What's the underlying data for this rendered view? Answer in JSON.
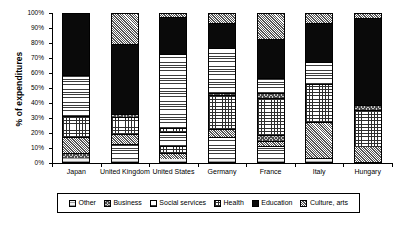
{
  "chart_data": {
    "type": "bar",
    "subtype": "stacked-100-percent",
    "title": "",
    "xlabel": "",
    "ylabel": "% of expenditures",
    "ylim": [
      0,
      100
    ],
    "yticks": [
      "0%",
      "10%",
      "20%",
      "30%",
      "40%",
      "50%",
      "60%",
      "70%",
      "80%",
      "90%",
      "100%"
    ],
    "ytick_values": [
      0,
      10,
      20,
      30,
      40,
      50,
      60,
      70,
      80,
      90,
      100
    ],
    "grid": false,
    "legend_position": "bottom",
    "categories": [
      "Japan",
      "United Kingdom",
      "United States",
      "Germany",
      "France",
      "Italy",
      "Hungary"
    ],
    "series": [
      {
        "name": "Other",
        "pattern": "light-dots",
        "values": [
          3,
          2,
          2,
          2,
          2,
          2,
          1
        ]
      },
      {
        "name": "Business",
        "pattern": "checker",
        "values": [
          3,
          1,
          3,
          1,
          1,
          1,
          9
        ]
      },
      {
        "name": "Social services",
        "pattern": "horizontal-lines",
        "values": [
          11,
          9,
          1,
          15,
          9,
          1,
          0
        ]
      },
      {
        "name": "Health",
        "pattern": "grid",
        "values": [
          14,
          7,
          5,
          4,
          5,
          23,
          25
        ]
      },
      {
        "name": "Education",
        "pattern": "solid-black",
        "values": [
          27,
          20,
          9,
          23,
          26,
          15,
          3
        ]
      },
      {
        "name": "Culture, arts",
        "pattern": "stipple",
        "values": [
          42,
          61,
          80,
          55,
          57,
          58,
          62
        ]
      }
    ],
    "stacks": [
      {
        "category": "Japan",
        "segments": [
          {
            "name": "Other",
            "start": 0,
            "end": 3,
            "value": 3
          },
          {
            "name": "Business",
            "start": 3,
            "end": 6,
            "value": 3
          },
          {
            "name": "Culture, arts",
            "start": 6,
            "end": 17,
            "value": 11
          },
          {
            "name": "Health",
            "start": 17,
            "end": 31,
            "value": 14
          },
          {
            "name": "Social services",
            "start": 31,
            "end": 58,
            "value": 27
          },
          {
            "name": "Education",
            "start": 58,
            "end": 100,
            "value": 42
          }
        ]
      },
      {
        "category": "United Kingdom",
        "segments": [
          {
            "name": "Other",
            "start": 0,
            "end": 2,
            "value": 2
          },
          {
            "name": "Social services",
            "start": 2,
            "end": 12,
            "value": 10
          },
          {
            "name": "Culture, arts",
            "start": 12,
            "end": 19,
            "value": 7
          },
          {
            "name": "Health",
            "start": 19,
            "end": 30,
            "value": 11
          },
          {
            "name": "Business",
            "start": 30,
            "end": 32,
            "value": 2
          },
          {
            "name": "Education",
            "start": 32,
            "end": 79,
            "value": 47
          },
          {
            "name": "Culture, arts",
            "start": 79,
            "end": 100,
            "value": 21
          }
        ]
      },
      {
        "category": "United States",
        "segments": [
          {
            "name": "Other",
            "start": 0,
            "end": 2,
            "value": 2
          },
          {
            "name": "Culture, arts",
            "start": 2,
            "end": 6,
            "value": 4
          },
          {
            "name": "Health",
            "start": 6,
            "end": 11,
            "value": 5
          },
          {
            "name": "Social services",
            "start": 11,
            "end": 20,
            "value": 9
          },
          {
            "name": "Health",
            "start": 20,
            "end": 23,
            "value": 3
          },
          {
            "name": "Social services",
            "start": 23,
            "end": 72,
            "value": 49
          },
          {
            "name": "Education",
            "start": 72,
            "end": 97,
            "value": 25
          },
          {
            "name": "Culture, arts",
            "start": 97,
            "end": 100,
            "value": 3
          }
        ]
      },
      {
        "category": "Germany",
        "segments": [
          {
            "name": "Other",
            "start": 0,
            "end": 2,
            "value": 2
          },
          {
            "name": "Social services",
            "start": 2,
            "end": 17,
            "value": 15
          },
          {
            "name": "Culture, arts",
            "start": 17,
            "end": 22,
            "value": 5
          },
          {
            "name": "Health",
            "start": 22,
            "end": 45,
            "value": 23
          },
          {
            "name": "Business",
            "start": 45,
            "end": 46,
            "value": 1
          },
          {
            "name": "Social services",
            "start": 46,
            "end": 76,
            "value": 30
          },
          {
            "name": "Education",
            "start": 76,
            "end": 93,
            "value": 17
          },
          {
            "name": "Culture, arts",
            "start": 93,
            "end": 100,
            "value": 7
          }
        ]
      },
      {
        "category": "France",
        "segments": [
          {
            "name": "Other",
            "start": 0,
            "end": 2,
            "value": 2
          },
          {
            "name": "Social services",
            "start": 2,
            "end": 11,
            "value": 9
          },
          {
            "name": "Culture, arts",
            "start": 11,
            "end": 14,
            "value": 3
          },
          {
            "name": "Business",
            "start": 14,
            "end": 18,
            "value": 4
          },
          {
            "name": "Health",
            "start": 18,
            "end": 43,
            "value": 25
          },
          {
            "name": "Business",
            "start": 43,
            "end": 46,
            "value": 3
          },
          {
            "name": "Social services",
            "start": 46,
            "end": 56,
            "value": 10
          },
          {
            "name": "Education",
            "start": 56,
            "end": 82,
            "value": 26
          },
          {
            "name": "Culture, arts",
            "start": 82,
            "end": 100,
            "value": 18
          }
        ]
      },
      {
        "category": "Italy",
        "segments": [
          {
            "name": "Other",
            "start": 0,
            "end": 2,
            "value": 2
          },
          {
            "name": "Business",
            "start": 2,
            "end": 3,
            "value": 1
          },
          {
            "name": "Culture, arts",
            "start": 3,
            "end": 27,
            "value": 24
          },
          {
            "name": "Health",
            "start": 27,
            "end": 52,
            "value": 25
          },
          {
            "name": "Social services",
            "start": 52,
            "end": 67,
            "value": 15
          },
          {
            "name": "Education",
            "start": 67,
            "end": 93,
            "value": 26
          },
          {
            "name": "Culture, arts",
            "start": 93,
            "end": 100,
            "value": 7
          }
        ]
      },
      {
        "category": "Hungary",
        "segments": [
          {
            "name": "Culture, arts",
            "start": 0,
            "end": 10,
            "value": 10
          },
          {
            "name": "Health",
            "start": 10,
            "end": 35,
            "value": 25
          },
          {
            "name": "Business",
            "start": 35,
            "end": 38,
            "value": 3
          },
          {
            "name": "Education",
            "start": 38,
            "end": 96,
            "value": 58
          },
          {
            "name": "Culture, arts",
            "start": 96,
            "end": 100,
            "value": 4
          }
        ]
      }
    ],
    "legend": [
      {
        "label": "Other",
        "pattern": "light-dots"
      },
      {
        "label": "Business",
        "pattern": "checker"
      },
      {
        "label": "Social services",
        "pattern": "horizontal-lines"
      },
      {
        "label": "Health",
        "pattern": "grid"
      },
      {
        "label": "Education",
        "pattern": "solid-black"
      },
      {
        "label": "Culture, arts",
        "pattern": "stipple"
      }
    ]
  }
}
